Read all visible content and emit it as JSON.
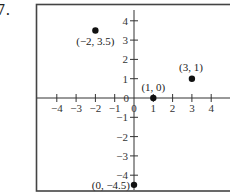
{
  "problem": {
    "number": "7."
  },
  "chart_data": {
    "type": "scatter",
    "title": "",
    "xlabel": "",
    "ylabel": "",
    "xlim": [
      -5,
      5
    ],
    "ylim": [
      -5,
      5
    ],
    "grid": false,
    "x_ticks": [
      -4,
      -3,
      -2,
      -1,
      0,
      1,
      2,
      3,
      4
    ],
    "x_tick_labels": [
      "−4",
      "−3",
      "−2",
      "−1",
      "0",
      "1",
      "2",
      "3",
      "4"
    ],
    "y_ticks": [
      4,
      3,
      2,
      1,
      0,
      -1,
      -2,
      -3,
      -4
    ],
    "y_tick_labels": [
      "4",
      "3",
      "2",
      "1",
      "0",
      "−1",
      "−2",
      "−3",
      "−4"
    ],
    "points": [
      {
        "x": -2,
        "y": 3.5,
        "label": "(−2, 3.5)"
      },
      {
        "x": 1,
        "y": 0,
        "label": "(1, 0)"
      },
      {
        "x": 3,
        "y": 1,
        "label": "(3, 1)"
      },
      {
        "x": 0,
        "y": -4.5,
        "label": "(0, −4.5)"
      }
    ],
    "colors": {
      "axis": "#333333",
      "frame": "#444444",
      "point": "#111111"
    }
  }
}
